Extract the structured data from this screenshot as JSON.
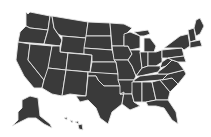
{
  "map": {
    "title": "United States map",
    "fill_color": "#3a3a3a",
    "border_color": "#e8e8e8",
    "background": "#ffffff",
    "regions": [
      "contiguous-us",
      "alaska",
      "hawaii"
    ]
  }
}
